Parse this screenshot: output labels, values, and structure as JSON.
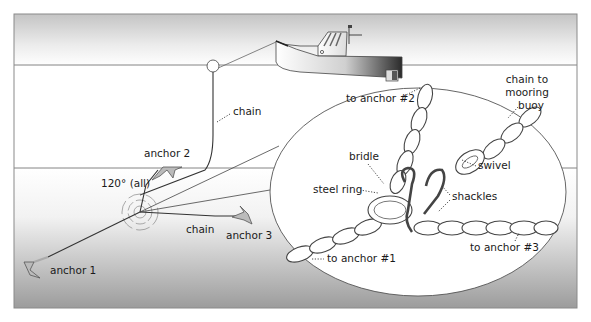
{
  "diagram": {
    "type": "three-anchor mooring system illustration",
    "overview_labels": {
      "chain_top": "chain",
      "anchor_2": "anchor 2",
      "angle": "120° (all)",
      "chain_bottom": "chain",
      "anchor_3": "anchor 3",
      "anchor_1": "anchor 1"
    },
    "detail_labels": {
      "to_anchor_2": "to anchor #2",
      "chain_to_buoy_line1": "chain to",
      "chain_to_buoy_line2": "mooring",
      "chain_to_buoy_line3": "buoy",
      "bridle": "bridle",
      "swivel": "swivel",
      "steel_ring": "steel ring",
      "shackles": "shackles",
      "to_anchor_1": "to anchor #1",
      "to_anchor_3": "to anchor #3"
    },
    "colors": {
      "frame": "#8a8a8a",
      "water_top_gradient": "#bdbdbd",
      "seabed_gradient": "#9a9a9a",
      "line": "#666666",
      "text": "#1a1a1a"
    }
  }
}
